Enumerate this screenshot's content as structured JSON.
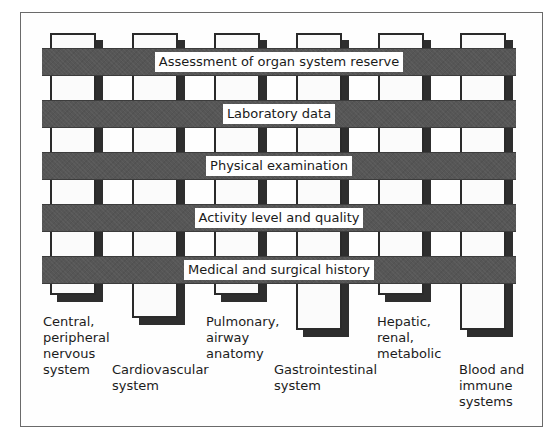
{
  "diagram": {
    "type": "woven-grid",
    "bars": [
      {
        "label": "Assessment of organ system reserve",
        "top": 48
      },
      {
        "label": "Laboratory data",
        "top": 100
      },
      {
        "label": "Physical examination",
        "top": 152
      },
      {
        "label": "Activity level and quality",
        "top": 204
      },
      {
        "label": "Medical and surgical history",
        "top": 256
      }
    ],
    "columns": [
      {
        "label": "Central,\nperipheral\nnervous\nsystem",
        "left": 50,
        "bottom": 295,
        "label_left": 43,
        "label_top": 314
      },
      {
        "label": "Cardiovascular\nsystem",
        "left": 132,
        "bottom": 318,
        "label_left": 112,
        "label_top": 362
      },
      {
        "label": "Pulmonary,\nairway\nanatomy",
        "left": 214,
        "bottom": 295,
        "label_left": 206,
        "label_top": 314
      },
      {
        "label": "Gastrointestinal\nsystem",
        "left": 296,
        "bottom": 330,
        "label_left": 274,
        "label_top": 362
      },
      {
        "label": "Hepatic,\nrenal,\nmetabolic",
        "left": 378,
        "bottom": 295,
        "label_left": 377,
        "label_top": 314
      },
      {
        "label": "Blood and\nimmune\nsystems",
        "left": 460,
        "bottom": 330,
        "label_left": 459,
        "label_top": 362
      }
    ],
    "colors": {
      "bar": "#565656",
      "column_outline": "#2a2a2a",
      "column_shadow": "#2e2e2e",
      "column_fill": "#fbfbfb",
      "label_bg": "#ffffff",
      "text": "#1a1a1a"
    }
  }
}
